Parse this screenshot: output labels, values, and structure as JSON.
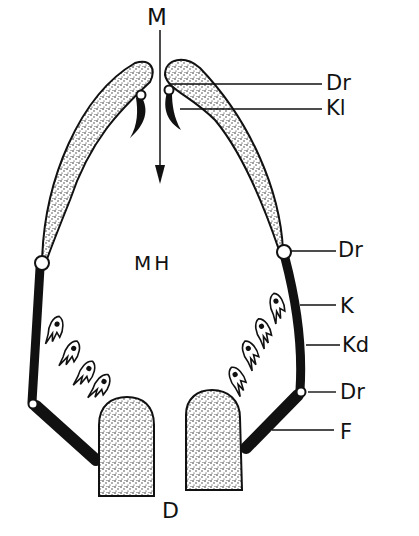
{
  "diagram": {
    "type": "anatomical-schematic",
    "colors": {
      "ink": "#111111",
      "background": "#ffffff",
      "stipple_fill": "#d8d8d8"
    },
    "labels": {
      "top": "M",
      "center": "MH",
      "bottom": "D",
      "right": [
        {
          "id": "dr_upper",
          "text": "Dr"
        },
        {
          "id": "kl",
          "text": "Kl"
        },
        {
          "id": "dr_middle",
          "text": "Dr"
        },
        {
          "id": "k",
          "text": "K"
        },
        {
          "id": "kd",
          "text": "Kd"
        },
        {
          "id": "dr_lower",
          "text": "Dr"
        },
        {
          "id": "f",
          "text": "F"
        }
      ]
    },
    "elements": {
      "arrow": "downward arrow from M into cavity",
      "upper_lobes": 2,
      "hinges": 6,
      "hooks": 2,
      "teeth_left": 4,
      "teeth_right": 4,
      "bottom_blocks": 2
    }
  }
}
